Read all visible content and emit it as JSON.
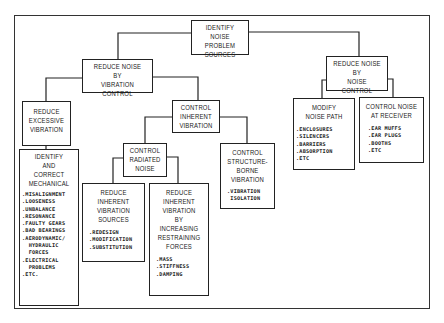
{
  "diagram": {
    "root": {
      "title": "IDENTIFY\nNOISE PROBLEM\nSOURCES"
    },
    "vibration_control": {
      "title": "REDUCE NOISE\nBY\nVIBRATION CONTROL"
    },
    "noise_control": {
      "title": "REDUCE NOISE\nBY\nNOISE CONTROL"
    },
    "reduce_excessive": {
      "title": "REDUCE\nEXCESSIVE\nVIBRATION"
    },
    "identify_mechanical": {
      "title": "IDENTIFY\nAND\nCORRECT\nMECHANICAL",
      "items": [
        ".MISALIGNMENT",
        ".LOOSENESS",
        ".UNBALANCE",
        ".RESONANCE",
        ".FAULTY GEARS",
        ".BAD BEARINGS",
        ".AERODYNAMIC/",
        "  HYDRAULIC",
        "  FORCES",
        ".ELECTRICAL",
        "  PROBLEMS",
        ".ETC."
      ]
    },
    "control_inherent": {
      "title": "CONTROL\nINHERENT\nVIBRATION"
    },
    "control_radiated": {
      "title": "CONTROL\nRADIATED\nNOISE"
    },
    "reduce_sources": {
      "title": "REDUCE\nINHERENT\nVIBRATION\nSOURCES",
      "items": [
        ".REDESIGN",
        ".MODIFICATION",
        ".SUBSTITUTION"
      ]
    },
    "reduce_restraining": {
      "title": "REDUCE\nINHERENT\nVIBRATION\nBY\nINCREASING\nRESTRAINING\nFORCES",
      "items": [
        ".MASS",
        ".STIFFNESS",
        ".DAMPING"
      ]
    },
    "structure_borne": {
      "title": "CONTROL\nSTRUCTURE-\nBORNE\nVIBRATION",
      "items": [
        ".VIBRATION",
        " ISOLATION"
      ]
    },
    "modify_path": {
      "title": "MODIFY\nNOISE PATH",
      "items": [
        ".ENCLOSURES",
        ".SILENCERS",
        ".BARRIERS",
        ".ABSORPTION",
        ".ETC"
      ]
    },
    "receiver": {
      "title": "CONTROL NOISE\nAT RECEIVER",
      "items": [
        ".EAR MUFFS",
        ".EAR PLUGS",
        ".BOOTHS",
        ".ETC"
      ]
    }
  }
}
